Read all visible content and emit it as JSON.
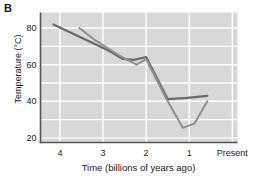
{
  "figure": {
    "panel_label": "B",
    "background_color": "#ffffff"
  },
  "chart_data": {
    "type": "line",
    "title": "",
    "panel": "B",
    "xlabel": "Time (billions of years ago)",
    "ylabel": "Temperature (°C)",
    "x_axis_reversed": true,
    "xlim": [
      4.45,
      -0.12
    ],
    "ylim": [
      17.5,
      88.5
    ],
    "xticks": [
      4,
      3,
      2,
      1,
      0
    ],
    "xtick_labels": [
      "4",
      "3",
      "2",
      "1",
      "Present"
    ],
    "yticks": [
      20,
      40,
      60,
      80
    ],
    "ytick_labels": [
      "20",
      "40",
      "60",
      "80"
    ],
    "gridlines": {
      "visible": true,
      "color": "#ffffff",
      "x_values": [
        4,
        3,
        2,
        1,
        0
      ],
      "y_values": [
        20,
        30,
        40,
        50,
        60,
        70,
        80
      ]
    },
    "plot_background": "#d8d8d8",
    "axis_color": "#555555",
    "legend": {
      "visible": false,
      "position": "none"
    },
    "series": [
      {
        "name": "Upper estimate",
        "color": "#6a6a6a",
        "width": 2.2,
        "points": [
          [
            4.15,
            82.0
          ],
          [
            3.3,
            72.5
          ],
          [
            2.85,
            67.5
          ],
          [
            2.55,
            63.2
          ],
          [
            2.28,
            62.6
          ],
          [
            2.0,
            64.2
          ],
          [
            1.5,
            41.2
          ],
          [
            1.05,
            41.9
          ],
          [
            0.58,
            43.0
          ]
        ]
      },
      {
        "name": "Lower estimate",
        "color": "#8f8f8f",
        "width": 2.0,
        "points": [
          [
            3.55,
            80.0
          ],
          [
            3.22,
            74.0
          ],
          [
            2.62,
            65.0
          ],
          [
            2.22,
            60.0
          ],
          [
            2.0,
            63.0
          ],
          [
            1.52,
            41.0
          ],
          [
            1.15,
            25.5
          ],
          [
            0.88,
            27.8
          ],
          [
            0.58,
            40.0
          ]
        ]
      }
    ]
  }
}
